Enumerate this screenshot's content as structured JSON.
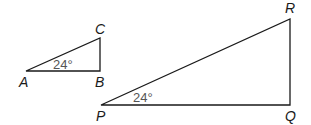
{
  "diagram": {
    "colors": {
      "stroke": "#1a1a1a",
      "angle_text": "#555555",
      "background": "#ffffff"
    },
    "triangles": [
      {
        "name": "ABC",
        "vertices": {
          "A": {
            "label": "A",
            "x": 26,
            "y": 71
          },
          "B": {
            "label": "B",
            "x": 100,
            "y": 71
          },
          "C": {
            "label": "C",
            "x": 100,
            "y": 38
          }
        },
        "angle_label": "24°",
        "angle_at": "A"
      },
      {
        "name": "PQR",
        "vertices": {
          "P": {
            "label": "P",
            "x": 101,
            "y": 105
          },
          "Q": {
            "label": "Q",
            "x": 290,
            "y": 105
          },
          "R": {
            "label": "R",
            "x": 290,
            "y": 19
          }
        },
        "angle_label": "24°",
        "angle_at": "P"
      }
    ]
  }
}
